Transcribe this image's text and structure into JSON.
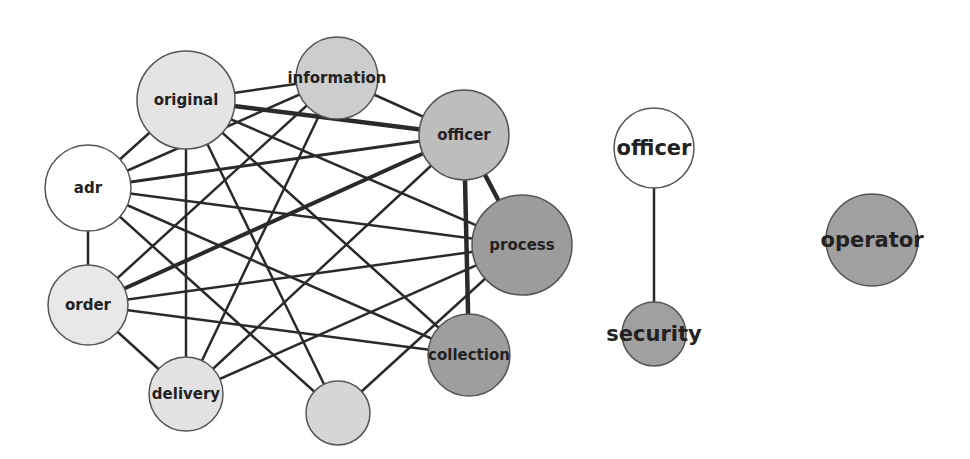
{
  "diagram": {
    "type": "network-graph",
    "nodes": [
      {
        "id": "original",
        "label": "original",
        "x": 186,
        "y": 100,
        "r": 49,
        "fill": "#e4e4e4",
        "font_size": 15
      },
      {
        "id": "information",
        "label": "information",
        "x": 337,
        "y": 78,
        "r": 41,
        "fill": "#cdcdcd",
        "font_size": 15
      },
      {
        "id": "officer",
        "label": "officer",
        "x": 464,
        "y": 135,
        "r": 45,
        "fill": "#bdbdbd",
        "font_size": 15
      },
      {
        "id": "adr",
        "label": "adr",
        "x": 88,
        "y": 188,
        "r": 43,
        "fill": "#ffffff",
        "font_size": 15
      },
      {
        "id": "process",
        "label": "process",
        "x": 522,
        "y": 245,
        "r": 50,
        "fill": "#9c9c9c",
        "font_size": 15
      },
      {
        "id": "order",
        "label": "order",
        "x": 88,
        "y": 305,
        "r": 40,
        "fill": "#e8e8e8",
        "font_size": 15
      },
      {
        "id": "collection",
        "label": "collection",
        "x": 469,
        "y": 355,
        "r": 41,
        "fill": "#9e9e9e",
        "font_size": 15
      },
      {
        "id": "delivery",
        "label": "delivery",
        "x": 186,
        "y": 394,
        "r": 37,
        "fill": "#e2e2e2",
        "font_size": 15
      },
      {
        "id": "unlabeled",
        "label": "",
        "x": 338,
        "y": 413,
        "r": 32,
        "fill": "#d6d6d6",
        "font_size": 15
      },
      {
        "id": "officer-2",
        "label": "officer",
        "x": 654,
        "y": 148,
        "r": 40,
        "fill": "#ffffff",
        "font_size": 21
      },
      {
        "id": "security",
        "label": "security",
        "x": 654,
        "y": 334,
        "r": 32,
        "fill": "#a0a0a0",
        "font_size": 21
      },
      {
        "id": "operator",
        "label": "operator",
        "x": 872,
        "y": 240,
        "r": 46,
        "fill": "#a0a0a0",
        "font_size": 21
      }
    ],
    "edges": [
      {
        "source": "original",
        "target": "information",
        "width": 2.5
      },
      {
        "source": "original",
        "target": "officer",
        "width": 4.5
      },
      {
        "source": "original",
        "target": "adr",
        "width": 2.5
      },
      {
        "source": "original",
        "target": "process",
        "width": 2.5
      },
      {
        "source": "original",
        "target": "collection",
        "width": 2.5
      },
      {
        "source": "original",
        "target": "delivery",
        "width": 2.5
      },
      {
        "source": "original",
        "target": "unlabeled",
        "width": 2.5
      },
      {
        "source": "information",
        "target": "officer",
        "width": 2.5
      },
      {
        "source": "information",
        "target": "adr",
        "width": 2.5
      },
      {
        "source": "information",
        "target": "order",
        "width": 2.5
      },
      {
        "source": "information",
        "target": "delivery",
        "width": 2.5
      },
      {
        "source": "officer",
        "target": "process",
        "width": 4.5
      },
      {
        "source": "officer",
        "target": "collection",
        "width": 4.5
      },
      {
        "source": "officer",
        "target": "adr",
        "width": 3
      },
      {
        "source": "officer",
        "target": "order",
        "width": 4
      },
      {
        "source": "officer",
        "target": "delivery",
        "width": 2.5
      },
      {
        "source": "adr",
        "target": "process",
        "width": 2.5
      },
      {
        "source": "adr",
        "target": "order",
        "width": 2.5
      },
      {
        "source": "adr",
        "target": "collection",
        "width": 2.5
      },
      {
        "source": "adr",
        "target": "unlabeled",
        "width": 2.5
      },
      {
        "source": "process",
        "target": "order",
        "width": 2.5
      },
      {
        "source": "process",
        "target": "delivery",
        "width": 2.5
      },
      {
        "source": "process",
        "target": "unlabeled",
        "width": 2.5
      },
      {
        "source": "order",
        "target": "collection",
        "width": 2.5
      },
      {
        "source": "order",
        "target": "delivery",
        "width": 2.5
      },
      {
        "source": "officer-2",
        "target": "security",
        "width": 2.5
      }
    ],
    "colors": {
      "edge": "#2a2a2a",
      "node_stroke": "#555555",
      "label": "#222222",
      "background": "#ffffff"
    }
  }
}
